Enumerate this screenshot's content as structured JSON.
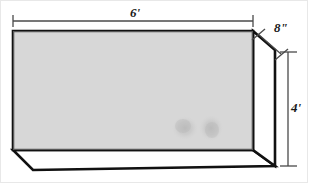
{
  "figure": {
    "type": "3d-isometric-box-diagram",
    "dimensions": {
      "width": {
        "label": "6'",
        "value": 6,
        "unit": "feet",
        "name": "width-dimension"
      },
      "depth": {
        "label": "8\"",
        "value": 8,
        "unit": "inches",
        "name": "depth-dimension"
      },
      "height": {
        "label": "4'",
        "value": 4,
        "unit": "feet",
        "name": "height-dimension"
      }
    },
    "colors": {
      "front_face_fill": "#d6d6d6",
      "side_face_fill": "#ffffff",
      "bottom_face_fill": "#ffffff",
      "outline": "#111111",
      "dimension_line": "#4a4a4a",
      "stain": "#b9b9b9",
      "background": "#ffffff",
      "canvas_border": "#e8e8e8"
    },
    "geometry": {
      "front_face": "13,31 253,31 253,150 13,150",
      "side_face": "253,31 275,50 275,166 253,150",
      "bottom_face": "13,150 253,150 275,166 33,170",
      "depth_offset_x": 22,
      "depth_offset_y": 19
    },
    "marks": [
      {
        "name": "stain-blotch-left",
        "cx": 185,
        "cy": 128,
        "rx": 12,
        "ry": 11
      },
      {
        "name": "stain-blotch-right",
        "cx": 211,
        "cy": 128,
        "rx": 11,
        "ry": 12
      }
    ],
    "dimension_lines": {
      "width": {
        "x1": 13,
        "y1": 21,
        "x2": 253,
        "y2": 21,
        "tick_half": 6
      },
      "depth": {
        "x1": 258,
        "y1": 35,
        "x2": 280,
        "y2": 54
      },
      "height": {
        "x1": 288,
        "y1": 52,
        "x2": 288,
        "y2": 166,
        "tick_half": 8
      }
    }
  }
}
